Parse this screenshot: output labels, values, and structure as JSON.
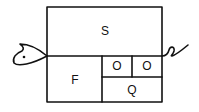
{
  "diagram": {
    "cells": {
      "top": "S",
      "left": "F",
      "small_left": "O",
      "small_right": "O",
      "bottom_right": "Q"
    },
    "decorations": {
      "head": "fish-head",
      "tail": "curly-tail"
    },
    "colors": {
      "stroke": "#111111",
      "background": "#ffffff"
    }
  }
}
